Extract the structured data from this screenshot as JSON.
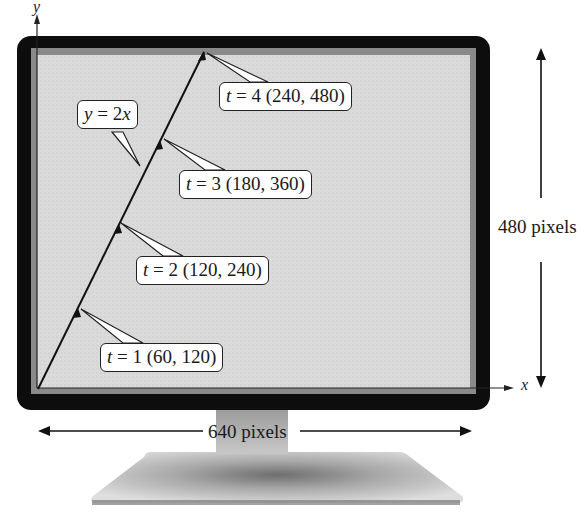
{
  "figure": {
    "type": "monitor-parametric-line-diagram",
    "colors": {
      "bezel": "#0d0d0d",
      "screen_border": "#8a8a8a",
      "screen_fill": "#dcdcdc",
      "stand": "#bdbdbd",
      "callout_bg": "#ffffff",
      "ink": "#1a1a1a"
    }
  },
  "axes": {
    "x_label": "x",
    "y_label": "y"
  },
  "line": {
    "equation_prefix": "y = 2",
    "equation_var": "x"
  },
  "points": [
    {
      "t_label": "t",
      "eq": " = 1 ",
      "coords": "(60, 120)",
      "t": 1,
      "x": 60,
      "y": 120
    },
    {
      "t_label": "t",
      "eq": " = 2 ",
      "coords": "(120, 240)",
      "t": 2,
      "x": 120,
      "y": 240
    },
    {
      "t_label": "t",
      "eq": " = 3 ",
      "coords": "(180, 360)",
      "t": 3,
      "x": 180,
      "y": 360
    },
    {
      "t_label": "t",
      "eq": " = 4 ",
      "coords": "(240, 480)",
      "t": 4,
      "x": 240,
      "y": 480
    }
  ],
  "dimensions": {
    "height_label": "480 pixels",
    "width_label": "640 pixels"
  }
}
